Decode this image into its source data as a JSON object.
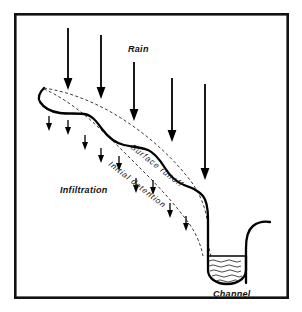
{
  "figure": {
    "kind": "hydrology-runoff-cross-section-diagram",
    "background_color": "#ffffff",
    "ink_color": "#111111",
    "frame": {
      "x": 14,
      "y": 13,
      "width": 274,
      "height": 285,
      "stroke_color": "#111111",
      "stroke_width": 2.6
    }
  },
  "labels": {
    "rain": "Rain",
    "surface_runoff": "Surface  runoff",
    "initial_detention": "Initial   detention",
    "infiltration": "Infiltration",
    "channel": "Channel"
  },
  "label_positions": {
    "rain": {
      "x": 128,
      "y": 52,
      "rotation": 0
    },
    "surface_runoff": {
      "x": 130,
      "y": 148,
      "rotation": 38
    },
    "initial_detention": {
      "x": 108,
      "y": 165,
      "rotation": 38
    },
    "infiltration": {
      "x": 60,
      "y": 193,
      "rotation": 0
    },
    "channel": {
      "x": 213,
      "y": 297,
      "rotation": 0
    }
  },
  "rain_arrows": [
    {
      "id": "rain-arrow-1",
      "x": 68,
      "y_start": 28,
      "y_end": 89
    },
    {
      "id": "rain-arrow-2",
      "x": 101,
      "y_start": 35,
      "y_end": 98
    },
    {
      "id": "rain-arrow-3",
      "x": 134,
      "y_start": 62,
      "y_end": 120
    },
    {
      "id": "rain-arrow-4",
      "x": 172,
      "y_start": 78,
      "y_end": 141
    },
    {
      "id": "rain-arrow-5",
      "x": 205,
      "y_start": 84,
      "y_end": 179
    }
  ],
  "infiltration_arrows": [
    {
      "id": "infiltration-arrow-1",
      "x": 49,
      "y_start": 116,
      "y_end": 130
    },
    {
      "id": "infiltration-arrow-2",
      "x": 68,
      "y_start": 120,
      "y_end": 134
    },
    {
      "id": "infiltration-arrow-3",
      "x": 85,
      "y_start": 135,
      "y_end": 149
    },
    {
      "id": "infiltration-arrow-4",
      "x": 101,
      "y_start": 148,
      "y_end": 162
    },
    {
      "id": "infiltration-arrow-5",
      "x": 119,
      "y_start": 156,
      "y_end": 170
    },
    {
      "id": "infiltration-arrow-6",
      "x": 136,
      "y_start": 178,
      "y_end": 192
    },
    {
      "id": "infiltration-arrow-7",
      "x": 153,
      "y_start": 180,
      "y_end": 194
    },
    {
      "id": "infiltration-arrow-8",
      "x": 170,
      "y_start": 203,
      "y_end": 217
    },
    {
      "id": "infiltration-arrow-9",
      "x": 186,
      "y_start": 216,
      "y_end": 230
    }
  ],
  "ground_surface": {
    "description": "thick irregular hillslope profile descending left-to-right into channel",
    "path": "M 44,88 C 40,92 37,97 40,102 C 44,108 52,112 60,113 C 68,114 76,113 84,114 C 92,115 97,122 102,129 C 108,137 115,143 124,145 C 132,147 140,147 148,150 C 155,153 160,160 165,168 C 170,176 176,182 184,185 C 192,188 198,190 203,196 C 207,201 208,210 208,219 C 208,228 208,237 208,248"
  },
  "channel": {
    "description": "U-shaped stream channel holding water",
    "left_bank_x": 208,
    "right_bank_x": 246,
    "water_level_y": 256,
    "bottom_y": 283,
    "right_bank_path": "M 246,283 C 246,270 246,258 246,246 C 246,238 248,230 253,226 C 258,222 264,221 270,222",
    "bowl_path": "M 208,256 L 208,270 C 208,278 216,284 227,284 C 238,284 246,278 246,270 L 246,256",
    "water_wave_count": 5,
    "water_wave_color": "#2b2b2b"
  },
  "flow_lines": [
    {
      "id": "surface-runoff-dashed",
      "label_ref": "surface_runoff",
      "style": "dashed",
      "path": "M 44,88 C 70,92 98,103 124,120 C 150,137 172,157 190,180 C 202,196 208,214 208,232 C 208,244 209,250 211,256"
    },
    {
      "id": "initial-detention-dashed",
      "label_ref": "initial_detention",
      "style": "dashed",
      "path": "M 44,89 C 62,97 80,110 97,126 C 114,142 130,158 146,174 C 162,190 176,206 188,222 C 196,233 201,245 203,256"
    }
  ]
}
